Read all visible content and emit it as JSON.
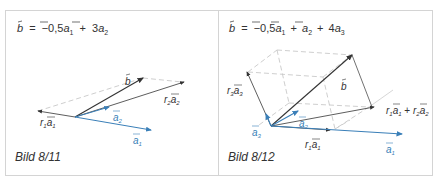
{
  "figures": [
    {
      "id": "left",
      "formula": "b⃗ = −0,5 a⃗₁ + 3 a⃗₂",
      "formula_parts": {
        "lhs": "b",
        "eq": "=",
        "c1": "−0,5",
        "v1": "a",
        "s1": "1",
        "plus": "+",
        "c2": "3",
        "v2": "a",
        "s2": "2"
      },
      "caption": "Bild 8/11",
      "labels": {
        "b": "b",
        "r2a2": [
          "r",
          "2",
          "a",
          "2"
        ],
        "a2": [
          "a",
          "2"
        ],
        "r1a1": [
          "r",
          "1",
          "a",
          "1"
        ],
        "a1": [
          "a",
          "1"
        ]
      }
    },
    {
      "id": "right",
      "formula": "b⃗ = −0,5 a⃗₁ + a⃗₂ + 4 a⃗₃",
      "formula_parts": {
        "lhs": "b",
        "eq": "=",
        "c1": "−0,5",
        "v1": "a",
        "s1": "1",
        "plus1": "+",
        "v2": "a",
        "s2": "2",
        "plus2": "+",
        "c3": "4",
        "v3": "a",
        "s3": "3"
      },
      "caption": "Bild 8/12",
      "labels": {
        "b": "b",
        "r3a3": [
          "r",
          "3",
          "a",
          "3"
        ],
        "sum": "r₁a₁ + r₂a₂",
        "a2": [
          "a",
          "2"
        ],
        "a3": [
          "a",
          "3"
        ],
        "r1a1": [
          "r",
          "1",
          "a",
          "1"
        ],
        "a1": [
          "a",
          "1"
        ]
      }
    }
  ],
  "colors": {
    "border": "#d4d4d4",
    "dark": "#333333",
    "blue": "#3a7fb8",
    "dashed": "#c8c8c8"
  }
}
